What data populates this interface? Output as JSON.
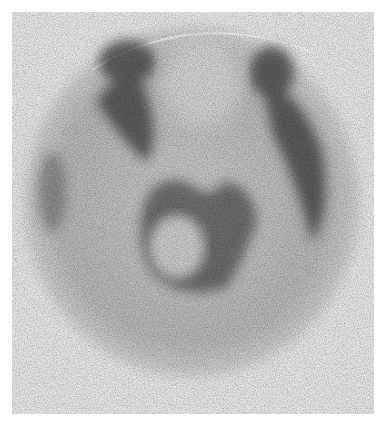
{
  "image": {
    "description": "Grayscale nuclear medicine scintigram (brain scan) showing elliptical head outline with darker uptake regions",
    "background_color": "#e6e6e6",
    "outline_color": "#9a9a9a",
    "uptake_color": "#2a2a2a",
    "paper_color": "#ffffff"
  }
}
